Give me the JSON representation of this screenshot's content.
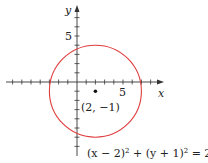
{
  "diagram": {
    "type": "circle-on-axes",
    "axes": {
      "x_label": "x",
      "y_label": "y",
      "x_tick_label": "5",
      "y_tick_label": "5",
      "x_range": [
        -8,
        9
      ],
      "y_range": [
        -7,
        8
      ],
      "tick_spacing": 1
    },
    "circle": {
      "center": [
        2,
        -1
      ],
      "radius": 5,
      "color": "#e03c3c"
    },
    "center_point_label": "(2, −1)",
    "equation": "(x − 2)² + (y + 1)² = 25",
    "equation_parts": {
      "lhs1": "(x − 2)",
      "exp1": "2",
      "plus": " + (y + 1)",
      "exp2": "2",
      "rhs": " = 25"
    }
  }
}
